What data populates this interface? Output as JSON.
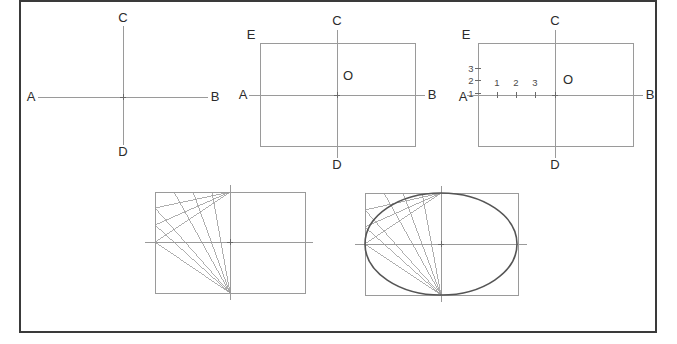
{
  "frame": {
    "name": "outer-border",
    "x": 19,
    "y": 0,
    "width": 638,
    "height": 333,
    "color": "#3a3a3a",
    "stroke_width": 2
  },
  "style": {
    "background": "#ffffff",
    "construction_line_color": "#9a9a9a",
    "rect_line_color": "#9a9a9a",
    "axis_line_color": "#9a9a9a",
    "ellipse_color": "#555555",
    "label_color": "#2b2b2b",
    "tick_color": "#6a6a6a"
  },
  "figures": [
    {
      "id": "step-1-axes",
      "title_labels": [
        "A",
        "B",
        "C",
        "D"
      ],
      "axes": {
        "center_x": 123,
        "center_y": 97,
        "horizontal": {
          "x1": 38,
          "x2": 208,
          "y": 97
        },
        "vertical": {
          "y1": 26,
          "y2": 145,
          "x": 123
        }
      },
      "labels": [
        {
          "text": "A",
          "x": 31,
          "y": 101,
          "anchor": "middle"
        },
        {
          "text": "B",
          "x": 215,
          "y": 101,
          "anchor": "middle"
        },
        {
          "text": "C",
          "x": 123,
          "y": 22,
          "anchor": "middle"
        },
        {
          "text": "D",
          "x": 123,
          "y": 156,
          "anchor": "middle"
        }
      ]
    },
    {
      "id": "step-2-rectangle",
      "rect": {
        "x": 260,
        "y": 43,
        "width": 155,
        "height": 103
      },
      "axes": {
        "center_x": 337,
        "center_y": 95,
        "horizontal": {
          "x1": 249,
          "x2": 425,
          "y": 95
        },
        "vertical": {
          "y1": 30,
          "y2": 158,
          "x": 337
        }
      },
      "labels": [
        {
          "text": "A",
          "x": 243,
          "y": 99,
          "anchor": "middle"
        },
        {
          "text": "B",
          "x": 432,
          "y": 99,
          "anchor": "middle"
        },
        {
          "text": "C",
          "x": 337,
          "y": 25,
          "anchor": "middle"
        },
        {
          "text": "D",
          "x": 337,
          "y": 169,
          "anchor": "middle"
        },
        {
          "text": "E",
          "x": 251,
          "y": 39,
          "anchor": "middle"
        },
        {
          "text": "O",
          "x": 348,
          "y": 80,
          "anchor": "middle"
        }
      ]
    },
    {
      "id": "step-3-divisions",
      "rect": {
        "x": 478,
        "y": 43,
        "width": 155,
        "height": 103
      },
      "axes": {
        "center_x": 555,
        "center_y": 95,
        "horizontal": {
          "x1": 467,
          "x2": 643,
          "y": 95
        },
        "vertical": {
          "y1": 30,
          "y2": 158,
          "x": 555
        }
      },
      "labels": [
        {
          "text": "A",
          "x": 463,
          "y": 101,
          "anchor": "middle"
        },
        {
          "text": "B",
          "x": 650,
          "y": 99,
          "anchor": "middle"
        },
        {
          "text": "C",
          "x": 555,
          "y": 25,
          "anchor": "middle"
        },
        {
          "text": "D",
          "x": 555,
          "y": 169,
          "anchor": "middle"
        },
        {
          "text": "E",
          "x": 466,
          "y": 39,
          "anchor": "middle"
        },
        {
          "text": "O",
          "x": 568,
          "y": 84,
          "anchor": "middle"
        }
      ],
      "horizontal_ticks": [
        {
          "label": "1",
          "x": 497,
          "label_y": 86
        },
        {
          "label": "2",
          "x": 516,
          "label_y": 86
        },
        {
          "label": "3",
          "x": 535,
          "label_y": 86
        }
      ],
      "vertical_ticks": [
        {
          "label": "1",
          "y": 93,
          "label_x": 471
        },
        {
          "label": "2",
          "y": 80,
          "label_x": 471
        },
        {
          "label": "3",
          "y": 68,
          "label_x": 471
        }
      ]
    },
    {
      "id": "step-4-construction-rays",
      "rect": {
        "x": 155,
        "y": 192,
        "width": 150,
        "height": 101
      },
      "axes": {
        "center_x": 230,
        "center_y": 242,
        "horizontal": {
          "x1": 145,
          "x2": 313,
          "y": 242
        },
        "vertical": {
          "y1": 185,
          "y2": 300,
          "x": 230
        }
      },
      "apex_top": {
        "x": 230,
        "y": 192
      },
      "apex_bottom": {
        "x": 230,
        "y": 293
      },
      "edge_points": [
        {
          "x": 155,
          "y": 208
        },
        {
          "x": 155,
          "y": 225
        },
        {
          "x": 155,
          "y": 242
        }
      ],
      "top_edge_points": [
        {
          "x": 174,
          "y": 192
        },
        {
          "x": 193,
          "y": 192
        },
        {
          "x": 212,
          "y": 192
        }
      ],
      "show_ellipse": false
    },
    {
      "id": "step-5-ellipse",
      "rect": {
        "x": 365,
        "y": 193,
        "width": 153,
        "height": 102
      },
      "axes": {
        "center_x": 441,
        "center_y": 244,
        "horizontal": {
          "x1": 355,
          "x2": 527,
          "y": 244
        },
        "vertical": {
          "y1": 186,
          "y2": 302,
          "x": 441
        }
      },
      "apex_top": {
        "x": 441,
        "y": 193
      },
      "apex_bottom": {
        "x": 441,
        "y": 295
      },
      "edge_points": [
        {
          "x": 365,
          "y": 210
        },
        {
          "x": 365,
          "y": 227
        },
        {
          "x": 365,
          "y": 244
        }
      ],
      "top_edge_points": [
        {
          "x": 384,
          "y": 193
        },
        {
          "x": 403,
          "y": 193
        },
        {
          "x": 422,
          "y": 193
        }
      ],
      "ellipse": {
        "cx": 441,
        "cy": 244,
        "rx": 76,
        "ry": 51
      },
      "show_ellipse": true
    }
  ]
}
